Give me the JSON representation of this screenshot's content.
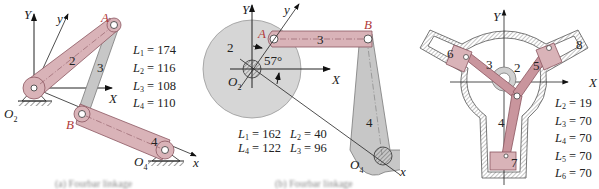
{
  "colors": {
    "link_pink": "#d9b3b8",
    "link_pink_stroke": "#8a5560",
    "link_gray": "#c7c7c7",
    "link_gray_stroke": "#7a7a7a",
    "disk_gray": "#d6d6d6",
    "label_red": "#b03a3a",
    "text": "#222222"
  },
  "figures": [
    {
      "id": "a",
      "axes": {
        "Y": "Y",
        "X": "X",
        "y": "y",
        "x": "x"
      },
      "points": {
        "A": "A",
        "B": "B",
        "O2": "O",
        "O2_sub": "2",
        "O4": "O",
        "O4_sub": "4"
      },
      "links": {
        "l2": "2",
        "l3": "3",
        "l4": "4"
      },
      "parameters": [
        {
          "sym": "L",
          "sub": "1",
          "value": "174"
        },
        {
          "sym": "L",
          "sub": "2",
          "value": "116"
        },
        {
          "sym": "L",
          "sub": "3",
          "value": "108"
        },
        {
          "sym": "L",
          "sub": "4",
          "value": "110"
        }
      ],
      "caption": "(a) Fourbar linkage"
    },
    {
      "id": "b",
      "axes": {
        "Y": "Y",
        "X": "X",
        "y": "y",
        "x": "x"
      },
      "points": {
        "A": "A",
        "B": "B",
        "O2": "O",
        "O2_sub": "2",
        "O4": "O",
        "O4_sub": "4"
      },
      "links": {
        "l2": "2",
        "l3": "3",
        "l4": "4"
      },
      "angle": "57°",
      "parameters": [
        {
          "sym": "L",
          "sub": "1",
          "value": "162"
        },
        {
          "sym": "L",
          "sub": "2",
          "value": "40"
        },
        {
          "sym": "L",
          "sub": "4",
          "value": "122"
        },
        {
          "sym": "L",
          "sub": "3",
          "value": "96"
        }
      ],
      "caption": "(b) Fourbar linkage"
    },
    {
      "id": "c",
      "axes": {
        "Y": "Y",
        "X": "X"
      },
      "links": {
        "l2": "2",
        "l3": "3",
        "l4": "4",
        "l5": "5",
        "l6": "6",
        "l7": "7",
        "l8": "8"
      },
      "parameters": [
        {
          "sym": "L",
          "sub": "2",
          "value": "19"
        },
        {
          "sym": "L",
          "sub": "3",
          "value": "70"
        },
        {
          "sym": "L",
          "sub": "4",
          "value": "70"
        },
        {
          "sym": "L",
          "sub": "5",
          "value": "70"
        },
        {
          "sym": "L",
          "sub": "6",
          "value": "70"
        }
      ],
      "caption": "(c) Radial compressor"
    }
  ]
}
